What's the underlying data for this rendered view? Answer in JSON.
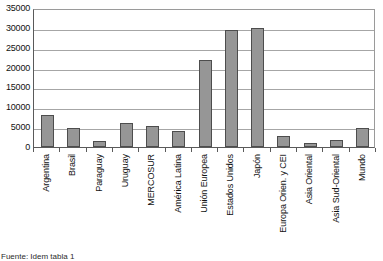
{
  "chart_data": {
    "type": "bar",
    "title": "",
    "xlabel": "",
    "ylabel": "",
    "ylim": [
      0,
      35000
    ],
    "ytick_step": 5000,
    "yticks": [
      35000,
      30000,
      25000,
      20000,
      15000,
      10000,
      5000,
      0
    ],
    "ytick_labels": [
      "35000",
      "30000",
      "25000",
      "20000",
      "15000",
      "10000",
      "5000",
      "0"
    ],
    "grid": true,
    "legend": false,
    "legend_position": "none",
    "bar_color": "#969696",
    "bar_border_color": "#4d4d4d",
    "categories": [
      "Argentina",
      "Brasil",
      "Paraguay",
      "Uruguay",
      "MERCOSUR",
      "América Latina",
      "Unión Europea",
      "Estados Unidos",
      "Japón",
      "Europa Orien. y CEI",
      "Asia Oriental",
      "Asia Sud-Oriental",
      "Mundo"
    ],
    "values": [
      8100,
      4700,
      1500,
      6000,
      5400,
      4000,
      22000,
      29500,
      29900,
      2800,
      1000,
      1800,
      4700
    ]
  },
  "footer": {
    "note": "Fuente: Idem tabla 1"
  }
}
